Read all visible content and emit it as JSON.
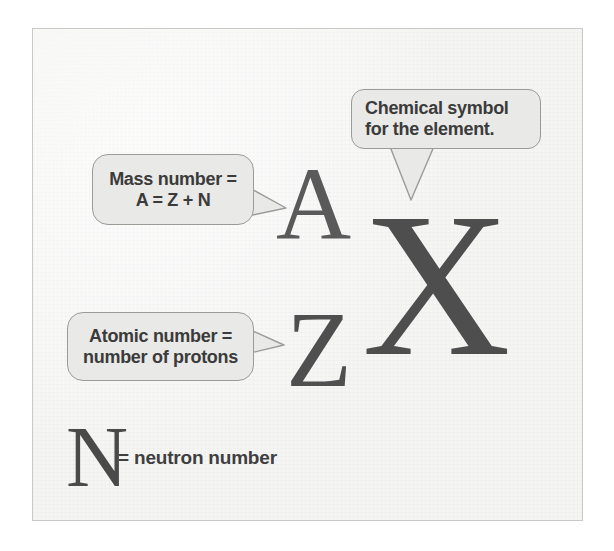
{
  "figure": {
    "kind": "nuclide-notation-diagram",
    "panel": {
      "background_color": "#f5f5f4",
      "border_color": "#c9c9c6"
    }
  },
  "notation": {
    "mass_number_symbol": "A",
    "atomic_number_symbol": "Z",
    "element_symbol": "X",
    "neutron_number_symbol": "N",
    "glyph_color": "#4a4a4a"
  },
  "legend": {
    "neutron_number_symbol": "N",
    "neutron_number_text": "= neutron number"
  },
  "callouts": {
    "chemical_symbol": {
      "line1": "Chemical symbol",
      "line2": "for the element.",
      "points_to": "X",
      "tail_direction": "down",
      "fill_color": "#e9e9e7",
      "border_color": "#9b9b98",
      "text_color": "#3b3b3b"
    },
    "mass_number": {
      "line1": "Mass number =",
      "line2": "A = Z + N",
      "points_to": "A",
      "tail_direction": "right",
      "fill_color": "#e9e9e7",
      "border_color": "#9b9b98",
      "text_color": "#3b3b3b"
    },
    "atomic_number": {
      "line1": "Atomic number =",
      "line2": "number of protons",
      "points_to": "Z",
      "tail_direction": "right",
      "fill_color": "#e9e9e7",
      "border_color": "#9b9b98",
      "text_color": "#3b3b3b"
    }
  }
}
